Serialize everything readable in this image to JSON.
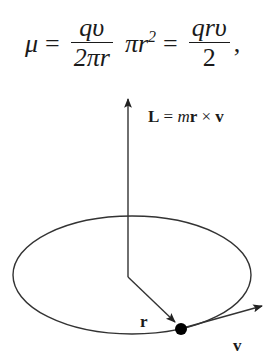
{
  "equation": {
    "lhs": "μ",
    "eq1": "=",
    "frac1_num": "qυ",
    "frac1_den": "2πr",
    "mid_term": "πr",
    "mid_exp": "2",
    "eq2": "=",
    "frac2_num": "qrυ",
    "frac2_den": "2",
    "trailing": ","
  },
  "diagram": {
    "angular_momentum_label": {
      "L": "L",
      "eq": " = ",
      "m": "m",
      "r": "r",
      "times": " × ",
      "v": "v"
    },
    "radius_label": "r",
    "velocity_label": "v",
    "stroke_color": "#333333",
    "particle_color": "#000000"
  }
}
